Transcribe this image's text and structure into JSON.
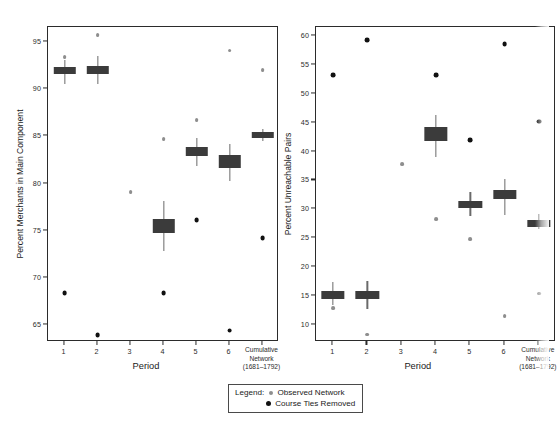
{
  "figure": {
    "background": "#ffffff",
    "box_color": "#3b3b3b",
    "whisker_color": "#6a6a6a",
    "observed_color": "#8e8e8e",
    "removed_color": "#111111",
    "axis_color": "#2b2b2b"
  },
  "legend": {
    "title": "Legend:",
    "items": [
      {
        "marker": "observed-dot",
        "label": "Observed Network"
      },
      {
        "marker": "removed-dot",
        "label": "Course Ties Removed"
      }
    ]
  },
  "chart_data": [
    {
      "type": "box",
      "id": "left",
      "title": "",
      "xlabel": "Period",
      "ylabel": "Percent Merchants in Main Component",
      "ylim": [
        63.2,
        96.6
      ],
      "yticks": [
        65,
        70,
        75,
        80,
        85,
        90,
        95
      ],
      "ytick_labels": [
        "65",
        "70",
        "75",
        "80",
        "85",
        "90",
        "95"
      ],
      "categories": [
        "1",
        "2",
        "3",
        "4",
        "5",
        "6",
        "Cumulative Network (1681–1792)"
      ],
      "xtick_labels": [
        "1",
        "2",
        "3",
        "4",
        "5",
        "6"
      ],
      "last_category_lines": [
        "Cumulative",
        "Network",
        "(1681–1792)"
      ],
      "grid": false,
      "legend_position": "below-center",
      "series": [
        {
          "name": "Course Ties Removed (box)",
          "boxes": [
            {
              "category": "1",
              "lower": 91.6,
              "upper": 92.4,
              "median": 92.0,
              "whisker_low": 90.6,
              "whisker_high": 93.1
            },
            {
              "category": "2",
              "lower": 91.6,
              "upper": 92.5,
              "median": 92.1,
              "whisker_low": 90.6,
              "whisker_high": 93.5
            },
            {
              "category": "3",
              "lower": null,
              "upper": null,
              "median": null,
              "whisker_low": null,
              "whisker_high": null
            },
            {
              "category": "4",
              "lower": 74.8,
              "upper": 76.2,
              "median": 75.5,
              "whisker_low": 72.8,
              "whisker_high": 78.1
            },
            {
              "category": "5",
              "lower": 82.9,
              "upper": 83.9,
              "median": 83.4,
              "whisker_low": 81.9,
              "whisker_high": 84.8
            },
            {
              "category": "6",
              "lower": 81.7,
              "upper": 83.0,
              "median": 82.3,
              "whisker_low": 80.3,
              "whisker_high": 84.2
            },
            {
              "category": "Cumulative Network (1681–1792)",
              "lower": 84.8,
              "upper": 85.5,
              "median": 85.1,
              "whisker_low": 84.5,
              "whisker_high": 85.8
            }
          ]
        },
        {
          "name": "Observed Network",
          "marker": "observed-dot",
          "points": [
            {
              "category": "1",
              "value": 93.4
            },
            {
              "category": "2",
              "value": 95.7
            },
            {
              "category": "3",
              "value": 79.1
            },
            {
              "category": "4",
              "value": 84.7
            },
            {
              "category": "5",
              "value": 86.7
            },
            {
              "category": "6",
              "value": 94.1
            },
            {
              "category": "Cumulative Network (1681–1792)",
              "value": 92.0
            }
          ]
        },
        {
          "name": "Course Ties Removed",
          "marker": "removed-dot",
          "points": [
            {
              "category": "1",
              "value": 68.4
            },
            {
              "category": "2",
              "value": 63.9
            },
            {
              "category": "4",
              "value": 68.4
            },
            {
              "category": "5",
              "value": 76.1
            },
            {
              "category": "6",
              "value": 64.4
            },
            {
              "category": "Cumulative Network (1681–1792)",
              "value": 74.2
            }
          ]
        }
      ]
    },
    {
      "type": "box",
      "id": "right",
      "title": "",
      "xlabel": "Period",
      "ylabel": "Percent Unreachable Pairs",
      "ylim": [
        7.0,
        61.6
      ],
      "yticks": [
        10,
        15,
        20,
        25,
        30,
        35,
        40,
        45,
        50,
        55,
        60
      ],
      "ytick_labels": [
        "10",
        "15",
        "20",
        "25",
        "30",
        "35",
        "40",
        "45",
        "50",
        "55",
        "60"
      ],
      "categories": [
        "1",
        "2",
        "3",
        "4",
        "5",
        "6",
        "Cumulative Network (1681–1792)"
      ],
      "xtick_labels": [
        "1",
        "2",
        "3",
        "4",
        "5",
        "6"
      ],
      "last_category_lines": [
        "Cumulative",
        "Network",
        "(1681–1792)"
      ],
      "grid": false,
      "clipped_at_right_edge": true,
      "series": [
        {
          "name": "Course Ties Removed (box)",
          "boxes": [
            {
              "category": "1",
              "lower": 14.5,
              "upper": 15.9,
              "median": 15.2,
              "whisker_low": 13.5,
              "whisker_high": 17.4
            },
            {
              "category": "2",
              "lower": 14.4,
              "upper": 15.8,
              "median": 15.1,
              "whisker_low": 12.7,
              "whisker_high": 17.5
            },
            {
              "category": "3",
              "lower": null,
              "upper": null,
              "median": null,
              "whisker_low": null,
              "whisker_high": null
            },
            {
              "category": "4",
              "lower": 41.9,
              "upper": 44.2,
              "median": 43.1,
              "whisker_low": 39.1,
              "whisker_high": 46.3
            },
            {
              "category": "5",
              "lower": 30.2,
              "upper": 31.4,
              "median": 30.8,
              "whisker_low": 28.8,
              "whisker_high": 33.0
            },
            {
              "category": "6",
              "lower": 31.7,
              "upper": 33.3,
              "median": 32.5,
              "whisker_low": 29.0,
              "whisker_high": 35.3
            },
            {
              "category": "Cumulative Network (1681–1792)",
              "lower": 27.0,
              "upper": 28.1,
              "median": 27.6,
              "whisker_low": 26.5,
              "whisker_high": 29.2
            }
          ]
        },
        {
          "name": "Observed Network",
          "marker": "observed-dot",
          "points": [
            {
              "category": "1",
              "value": 12.9
            },
            {
              "category": "2",
              "value": 8.3
            },
            {
              "category": "3",
              "value": 37.8
            },
            {
              "category": "4",
              "value": 28.3
            },
            {
              "category": "5",
              "value": 24.8
            },
            {
              "category": "6",
              "value": 11.5
            },
            {
              "category": "Cumulative Network (1681–1792)",
              "value": 15.4
            }
          ]
        },
        {
          "name": "Course Ties Removed",
          "marker": "removed-dot",
          "points": [
            {
              "category": "1",
              "value": 53.3
            },
            {
              "category": "2",
              "value": 59.3
            },
            {
              "category": "4",
              "value": 53.3
            },
            {
              "category": "5",
              "value": 42.0
            },
            {
              "category": "6",
              "value": 58.7
            },
            {
              "category": "Cumulative Network (1681–1792)",
              "value": 45.2
            }
          ]
        }
      ]
    }
  ]
}
